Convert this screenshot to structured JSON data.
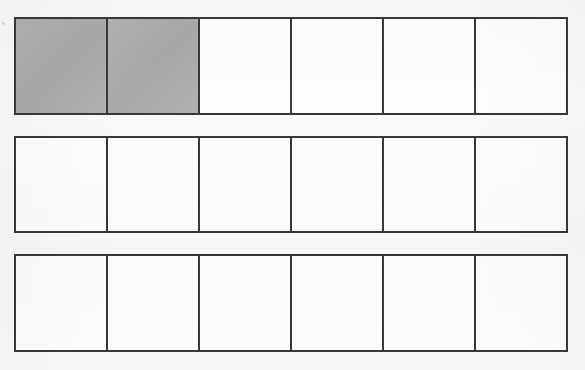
{
  "document": {
    "title": "Fraction Bars Worksheet",
    "background_color": "#f9f9f9",
    "border_color": "#383838",
    "shaded_color": "#adadad",
    "unshaded_color": "#fdfdfd"
  },
  "chart_data": {
    "type": "bar",
    "xlabel": "",
    "ylabel": "",
    "categories": [
      "Bar 1",
      "Bar 2",
      "Bar 3"
    ],
    "values": [
      2,
      0,
      0
    ],
    "ylim": [
      0,
      6
    ],
    "grid": false,
    "legend": "none",
    "series": [
      {
        "name": "Bar 1",
        "cells_total": 6,
        "cells_shaded": 2,
        "fraction": "2/6",
        "shaded_flags": [
          true,
          true,
          false,
          false,
          false,
          false
        ]
      },
      {
        "name": "Bar 2",
        "cells_total": 6,
        "cells_shaded": 0,
        "fraction": "0/6",
        "shaded_flags": [
          false,
          false,
          false,
          false,
          false,
          false
        ]
      },
      {
        "name": "Bar 3",
        "cells_total": 6,
        "cells_shaded": 0,
        "fraction": "0/6",
        "shaded_flags": [
          false,
          false,
          false,
          false,
          false,
          false
        ]
      }
    ]
  },
  "bars": [
    {
      "id": "bar-1",
      "label": "Fraction bar 1",
      "cells": [
        {
          "index": 1,
          "shaded": true,
          "label": ""
        },
        {
          "index": 2,
          "shaded": true,
          "label": ""
        },
        {
          "index": 3,
          "shaded": false,
          "label": ""
        },
        {
          "index": 4,
          "shaded": false,
          "label": ""
        },
        {
          "index": 5,
          "shaded": false,
          "label": ""
        },
        {
          "index": 6,
          "shaded": false,
          "label": ""
        }
      ]
    },
    {
      "id": "bar-2",
      "label": "Fraction bar 2",
      "cells": [
        {
          "index": 1,
          "shaded": false,
          "label": ""
        },
        {
          "index": 2,
          "shaded": false,
          "label": ""
        },
        {
          "index": 3,
          "shaded": false,
          "label": ""
        },
        {
          "index": 4,
          "shaded": false,
          "label": ""
        },
        {
          "index": 5,
          "shaded": false,
          "label": ""
        },
        {
          "index": 6,
          "shaded": false,
          "label": ""
        }
      ]
    },
    {
      "id": "bar-3",
      "label": "Fraction bar 3",
      "cells": [
        {
          "index": 1,
          "shaded": false,
          "label": ""
        },
        {
          "index": 2,
          "shaded": false,
          "label": ""
        },
        {
          "index": 3,
          "shaded": false,
          "label": ""
        },
        {
          "index": 4,
          "shaded": false,
          "label": ""
        },
        {
          "index": 5,
          "shaded": false,
          "label": ""
        },
        {
          "index": 6,
          "shaded": false,
          "label": ""
        }
      ]
    }
  ]
}
